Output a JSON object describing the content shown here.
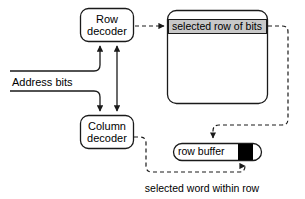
{
  "diagram": {
    "colors": {
      "stroke": "#1a1a1a",
      "band_fill": "#c8c8c8",
      "word_fill": "#000000",
      "background": "#ffffff"
    },
    "nodes": {
      "row_decoder": {
        "label": "Row\ndecoder"
      },
      "column_decoder": {
        "label": "Column\ndecoder"
      },
      "memory_array": {
        "band_label": "selected row of bits"
      },
      "row_buffer": {
        "label": "row buffer"
      }
    },
    "labels": {
      "address_bits": "Address bits",
      "caption": "selected word within row"
    },
    "edges": [
      {
        "name": "address-to-row-decoder",
        "style": "solid",
        "from": "Address bits",
        "to": "Row decoder"
      },
      {
        "name": "address-to-column-decoder",
        "style": "solid",
        "from": "Address bits",
        "to": "Column decoder"
      },
      {
        "name": "row-column-decoder-link",
        "style": "solid",
        "from": "Row decoder",
        "to": "Column decoder",
        "arrows": "both"
      },
      {
        "name": "row-decoder-to-array",
        "style": "dashed",
        "from": "Row decoder",
        "to": "selected row of bits"
      },
      {
        "name": "array-to-row-buffer",
        "style": "dashed",
        "from": "selected row of bits",
        "to": "row buffer"
      },
      {
        "name": "column-decoder-to-word",
        "style": "dashed",
        "from": "Column decoder",
        "to": "selected word within row"
      }
    ]
  }
}
